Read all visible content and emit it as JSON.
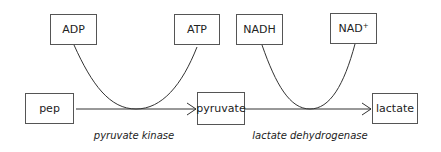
{
  "diagram": {
    "title": "",
    "nodes": {
      "adp": {
        "label": "ADP"
      },
      "atp": {
        "label": "ATP"
      },
      "nadh": {
        "label": "NADH"
      },
      "nad_plus": {
        "label": "NAD",
        "superscript": "+"
      },
      "pep": {
        "label": "pep"
      },
      "pyruvate": {
        "label": "pyruvate"
      },
      "lactate": {
        "label": "lactate"
      }
    },
    "enzymes": {
      "pyruvate_kinase": {
        "label": "pyruvate kinase"
      },
      "lactate_dehydrogenase": {
        "label": "lactate dehydrogenase"
      }
    },
    "edges": [
      {
        "from": "pep",
        "to": "pyruvate",
        "enzyme": "pyruvate kinase",
        "cofactor_in": "ADP",
        "cofactor_out": "ATP"
      },
      {
        "from": "pyruvate",
        "to": "lactate",
        "enzyme": "lactate dehydrogenase",
        "cofactor_in": "NADH",
        "cofactor_out": "NAD+"
      }
    ],
    "colors": {
      "line": "#333333",
      "border": "#555555",
      "text": "#222222"
    }
  }
}
